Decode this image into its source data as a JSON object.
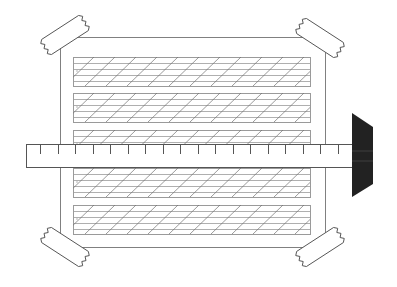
{
  "diagram": {
    "colors": {
      "background": "#ffffff",
      "outline": "#808080",
      "panel_line": "#9a9a9a",
      "hatch": "#707070",
      "ruler_outline": "#555555",
      "tick": "#555555",
      "clamp": "#222222",
      "tape_outline": "#555555"
    },
    "board": {
      "x": 60,
      "y": 37,
      "width": 265,
      "height": 210
    },
    "panels": [
      {
        "y": 57,
        "height": 29
      },
      {
        "y": 93,
        "height": 29
      },
      {
        "y": 130,
        "height": 29
      },
      {
        "y": 168,
        "height": 29
      },
      {
        "y": 205,
        "height": 29
      }
    ],
    "panel_x": 73,
    "panel_width": 237,
    "ruler": {
      "x": 26,
      "y": 144,
      "width": 326,
      "height": 23,
      "tick_count": 18,
      "tick_start": 40,
      "tick_spacing": 17.5
    },
    "clamp": {
      "points": "352,113 373,127 373,184 352,197"
    },
    "tapes": [
      {
        "name": "tape-top-left",
        "cx": 65,
        "cy": 35,
        "angle": -33
      },
      {
        "name": "tape-top-right",
        "cx": 320,
        "cy": 38,
        "angle": 33
      },
      {
        "name": "tape-bottom-left",
        "cx": 65,
        "cy": 247,
        "angle": 33
      },
      {
        "name": "tape-bottom-right",
        "cx": 320,
        "cy": 247,
        "angle": -33
      }
    ]
  }
}
